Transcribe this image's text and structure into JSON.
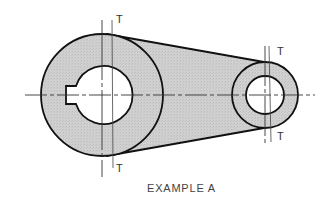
{
  "figure": {
    "caption": "EXAMPLE A",
    "tangent_label": "T",
    "tangent_labels": [
      {
        "position": "large-circle-top",
        "text": "T"
      },
      {
        "position": "large-circle-bottom",
        "text": "T"
      },
      {
        "position": "small-circle-top",
        "text": "T"
      },
      {
        "position": "small-circle-bottom",
        "text": "T"
      }
    ],
    "colors": {
      "outline": "#111111",
      "fill": "#cfcfcf",
      "centerline": "#333333",
      "background": "#ffffff"
    },
    "parts": {
      "large_boss": {
        "center": [
          102,
          95
        ],
        "outer_radius": 61,
        "bore_radius": 29,
        "keyway": true
      },
      "small_boss": {
        "center": [
          265,
          95
        ],
        "outer_radius": 33,
        "bore_radius": 19
      }
    }
  }
}
